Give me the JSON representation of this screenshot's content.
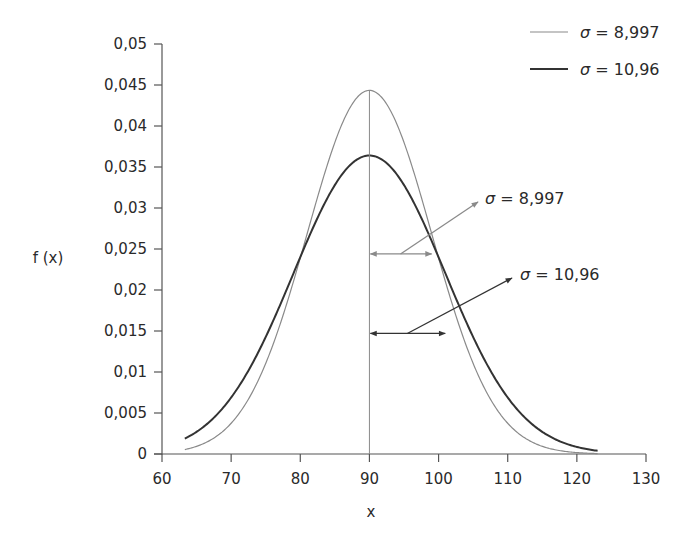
{
  "chart_data": {
    "type": "line",
    "title": "",
    "xlabel": "x",
    "ylabel": "f (x)",
    "xlim": [
      60,
      130
    ],
    "ylim": [
      0,
      0.05
    ],
    "grid": false,
    "legend_position": "top-right",
    "x_ticks": [
      60,
      70,
      80,
      90,
      100,
      110,
      120,
      130
    ],
    "x_tick_labels": [
      "60",
      "70",
      "80",
      "90",
      "100",
      "110",
      "120",
      "130"
    ],
    "y_ticks": [
      0,
      0.005,
      0.01,
      0.015,
      0.02,
      0.025,
      0.03,
      0.035,
      0.04,
      0.045,
      0.05
    ],
    "y_tick_labels": [
      "0",
      "0,005",
      "0,01",
      "0,015",
      "0,02",
      "0,025",
      "0,03",
      "0,035",
      "0,04",
      "0,045",
      "0,05"
    ],
    "series": [
      {
        "name": "σ = 8,997",
        "distribution": "normal",
        "mean": 90,
        "sigma": 8.997,
        "x_range": [
          63.3,
          123
        ],
        "peak": 0.0443,
        "color": "#8a8a8a",
        "line_width": 1.2
      },
      {
        "name": "σ = 10,96",
        "distribution": "normal",
        "mean": 90,
        "sigma": 10.96,
        "x_range": [
          63.3,
          123
        ],
        "peak": 0.0364,
        "color": "#333333",
        "line_width": 2
      }
    ],
    "reference_line": {
      "x": 90,
      "label": "mean"
    },
    "annotations": [
      {
        "label": "σ = 8,997",
        "arrow_from_x": 90,
        "arrow_to_x": 98.997,
        "y": 0.0244,
        "color": "#8a8a8a"
      },
      {
        "label": "σ = 10,96",
        "arrow_from_x": 90,
        "arrow_to_x": 100.96,
        "y": 0.0147,
        "color": "#333333"
      }
    ]
  },
  "legend": {
    "items": [
      {
        "symbol": "σ",
        "text": " = 8,997",
        "color": "#8a8a8a"
      },
      {
        "symbol": "σ",
        "text": " = 10,96",
        "color": "#333333"
      }
    ]
  },
  "annotations": [
    {
      "symbol": "σ",
      "text": " = 8,997"
    },
    {
      "symbol": "σ",
      "text": " = 10,96"
    }
  ]
}
